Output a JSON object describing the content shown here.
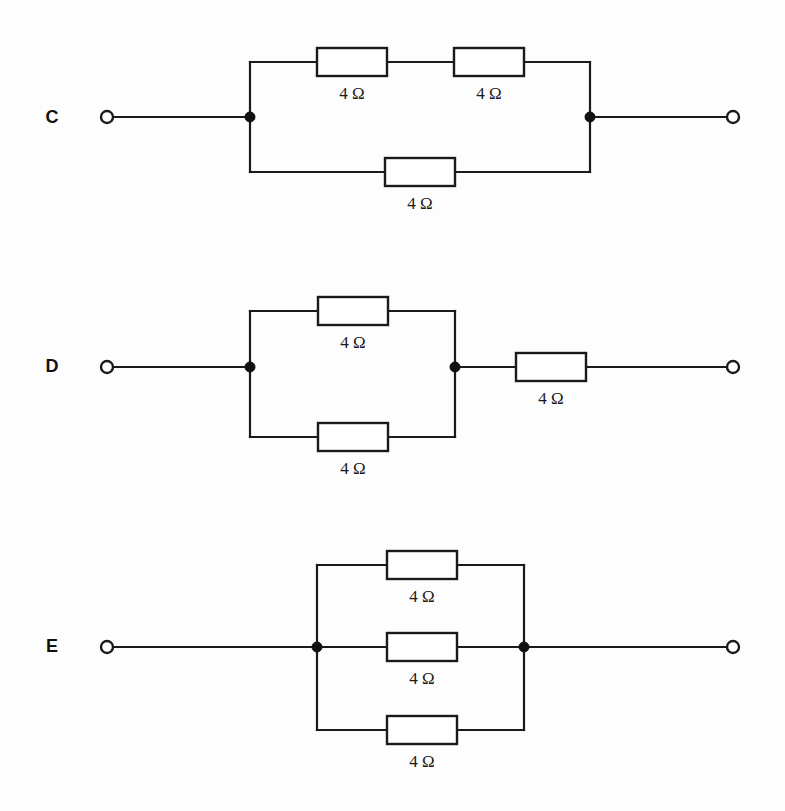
{
  "page": {
    "background_color": "#fdfdfd",
    "ink_color": "#1a1a1a",
    "width": 785,
    "height": 811
  },
  "circuits": [
    {
      "id": "c",
      "letter": "C",
      "description": "Two 4 ohm resistors in series on the top branch, in parallel with a single 4 ohm resistor on the bottom branch",
      "left_terminal": "open-terminal",
      "right_terminal": "open-terminal",
      "resistors": [
        {
          "name": "c-top-left-resistor",
          "value": "4 Ω",
          "branch": "top",
          "position": "left"
        },
        {
          "name": "c-top-right-resistor",
          "value": "4 Ω",
          "branch": "top",
          "position": "right"
        },
        {
          "name": "c-bottom-resistor",
          "value": "4 Ω",
          "branch": "bottom",
          "position": "center"
        }
      ],
      "junction_count": 2
    },
    {
      "id": "d",
      "letter": "D",
      "description": "Two 4 ohm resistors in parallel, then one 4 ohm resistor in series",
      "left_terminal": "open-terminal",
      "right_terminal": "open-terminal",
      "resistors": [
        {
          "name": "d-top-resistor",
          "value": "4 Ω",
          "branch": "top",
          "position": "center"
        },
        {
          "name": "d-bottom-resistor",
          "value": "4 Ω",
          "branch": "bottom",
          "position": "center"
        },
        {
          "name": "d-series-resistor",
          "value": "4 Ω",
          "branch": "series",
          "position": "right"
        }
      ],
      "junction_count": 2
    },
    {
      "id": "e",
      "letter": "E",
      "description": "Three 4 ohm resistors all in parallel",
      "left_terminal": "open-terminal",
      "right_terminal": "open-terminal",
      "resistors": [
        {
          "name": "e-top-resistor",
          "value": "4 Ω",
          "branch": "top",
          "position": "center"
        },
        {
          "name": "e-middle-resistor",
          "value": "4 Ω",
          "branch": "middle",
          "position": "center"
        },
        {
          "name": "e-bottom-resistor",
          "value": "4 Ω",
          "branch": "bottom",
          "position": "center"
        }
      ],
      "junction_count": 2
    }
  ]
}
